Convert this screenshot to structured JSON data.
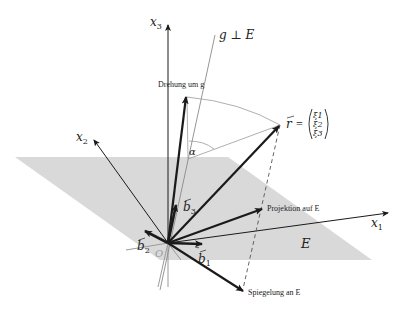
{
  "diagram": {
    "type": "3d-vector-geometry",
    "plane_color": "#d9d9d9",
    "line_color": "#1a1a1a",
    "thin_line_color": "#8a8a8a",
    "axes": {
      "x1": {
        "label": "x",
        "sub": "1"
      },
      "x2": {
        "label": "x",
        "sub": "2"
      },
      "x3": {
        "label": "x",
        "sub": "3"
      }
    },
    "line_g": {
      "label": "g ⊥ E"
    },
    "plane": {
      "label": "E"
    },
    "origin": {
      "label": "O"
    },
    "basis": {
      "b1": {
        "label": "b",
        "sub": "1"
      },
      "b2": {
        "label": "b",
        "sub": "2"
      },
      "b3": {
        "label": "b",
        "sub": "3"
      }
    },
    "vector_r": {
      "label": "r",
      "equals": "=",
      "components": [
        "ξ1",
        "ξ2",
        "ξ3"
      ]
    },
    "angle": {
      "label": "α"
    },
    "annotations": {
      "rotation": "Drehung um g",
      "projection": "Projektion auf E",
      "reflection": "Spiegelung an E"
    }
  }
}
